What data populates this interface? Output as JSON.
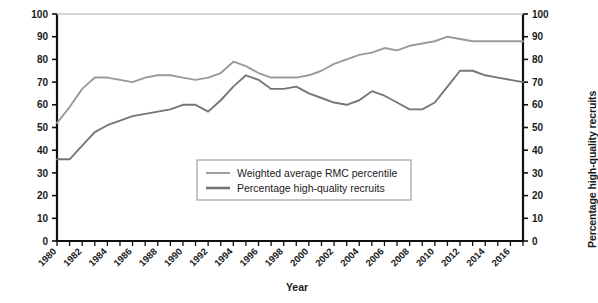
{
  "chart_data": {
    "type": "line",
    "title": "",
    "xlabel": "Year",
    "ylabel": "Weighted average RMC percentile",
    "ylabel_right": "Percentage high-quality recruits",
    "xlim": [
      1980,
      2017
    ],
    "ylim": [
      0,
      100
    ],
    "y_ticks": [
      0,
      10,
      20,
      30,
      40,
      50,
      60,
      70,
      80,
      90,
      100
    ],
    "y_ticks_right": [
      0,
      10,
      20,
      30,
      40,
      50,
      60,
      70,
      80,
      90,
      100
    ],
    "x_tick_labels": [
      "1980",
      "1982",
      "1984",
      "1986",
      "1988",
      "1990",
      "1992",
      "1994",
      "1996",
      "1998",
      "2000",
      "2002",
      "2004",
      "2006",
      "2008",
      "2010",
      "2012",
      "2014",
      "2016"
    ],
    "grid": false,
    "legend_position": "center",
    "x": [
      1980,
      1981,
      1982,
      1983,
      1984,
      1985,
      1986,
      1987,
      1988,
      1989,
      1990,
      1991,
      1992,
      1993,
      1994,
      1995,
      1996,
      1997,
      1998,
      1999,
      2000,
      2001,
      2002,
      2003,
      2004,
      2005,
      2006,
      2007,
      2008,
      2009,
      2010,
      2011,
      2012,
      2013,
      2014,
      2015,
      2016,
      2017
    ],
    "series": [
      {
        "name": "Weighted average RMC percentile",
        "color": "#9a9a9a",
        "values": [
          52,
          59,
          67,
          72,
          72,
          71,
          70,
          72,
          73,
          73,
          72,
          71,
          72,
          74,
          79,
          77,
          74,
          72,
          72,
          72,
          73,
          75,
          78,
          80,
          82,
          83,
          85,
          84,
          86,
          87,
          88,
          90,
          89,
          88,
          88,
          88,
          88,
          88
        ]
      },
      {
        "name": "Percentage high-quality recruits",
        "color": "#767676",
        "values": [
          36,
          36,
          42,
          48,
          51,
          53,
          55,
          56,
          57,
          58,
          60,
          60,
          57,
          62,
          68,
          73,
          71,
          67,
          67,
          68,
          65,
          63,
          61,
          60,
          62,
          66,
          64,
          61,
          58,
          58,
          61,
          68,
          75,
          75,
          73,
          72,
          71,
          70
        ]
      }
    ]
  },
  "legend": {
    "entries": [
      {
        "label": "Weighted average RMC percentile"
      },
      {
        "label": "Percentage high-quality recruits"
      }
    ]
  },
  "axes": {
    "left_title": "Weighted average RMC percentile",
    "right_title": "Percentage high-quality recruits",
    "bottom_title": "Year"
  }
}
